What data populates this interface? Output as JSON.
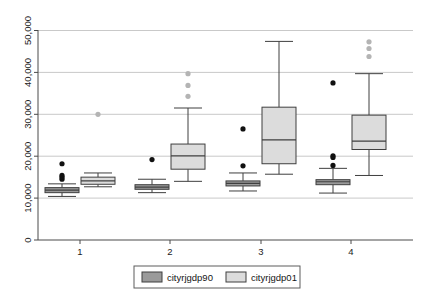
{
  "chart_data": {
    "type": "box",
    "title": "",
    "xlabel": "",
    "ylabel": "",
    "categories": [
      "1",
      "2",
      "3",
      "4"
    ],
    "xtick_labels": [
      "1",
      "2",
      "3",
      "4"
    ],
    "ytick_labels": [
      "0",
      "10,000",
      "20,000",
      "30,000",
      "40,000",
      "50,000"
    ],
    "ytick_values": [
      0,
      10000,
      20000,
      30000,
      40000,
      50000
    ],
    "ylim": [
      0,
      52000
    ],
    "grid": "horizontal",
    "legend_position": "bottom-center",
    "series": [
      {
        "name": "cityrjgdp90",
        "color": "#9a9a9a",
        "boxes": [
          {
            "category": "1",
            "min": 10400,
            "q1": 11300,
            "median": 11900,
            "q3": 12500,
            "max": 13400,
            "outliers": [
              14500,
              15000,
              15400,
              18200
            ]
          },
          {
            "category": "2",
            "min": 11300,
            "q1": 12100,
            "median": 12600,
            "q3": 13200,
            "max": 14500,
            "outliers": [
              19200
            ]
          },
          {
            "category": "3",
            "min": 11700,
            "q1": 12900,
            "median": 13500,
            "q3": 14100,
            "max": 16000,
            "outliers": [
              17700,
              26500
            ]
          },
          {
            "category": "4",
            "min": 11200,
            "q1": 13200,
            "median": 13900,
            "q3": 14400,
            "max": 17100,
            "outliers": [
              17800,
              19700,
              20100,
              37500
            ]
          }
        ]
      },
      {
        "name": "cityrjgdp01",
        "color": "#dcdcdc",
        "boxes": [
          {
            "category": "1",
            "min": 12700,
            "q1": 13300,
            "median": 14100,
            "q3": 15000,
            "max": 16000,
            "outliers": [
              30000
            ]
          },
          {
            "category": "2",
            "min": 14000,
            "q1": 16900,
            "median": 20100,
            "q3": 22900,
            "max": 31500,
            "outliers": [
              34300,
              36900,
              39700
            ]
          },
          {
            "category": "3",
            "min": 15700,
            "q1": 18200,
            "median": 23900,
            "q3": 31700,
            "max": 47400,
            "outliers": []
          },
          {
            "category": "4",
            "min": 15400,
            "q1": 21600,
            "median": 23600,
            "q3": 29800,
            "max": 39700,
            "outliers": [
              43800,
              45700,
              47300
            ]
          }
        ]
      }
    ],
    "legend": [
      {
        "label": "cityrjgdp90",
        "color": "#9a9a9a"
      },
      {
        "label": "cityrjgdp01",
        "color": "#dcdcdc"
      }
    ],
    "colors": {
      "series90": "#9a9a9a",
      "series01": "#dcdcdc",
      "grid": "#c9c9c9",
      "axis": "#4a4a4a",
      "outlier_dark": "#111111",
      "outlier_light": "#b4b4b4"
    }
  }
}
